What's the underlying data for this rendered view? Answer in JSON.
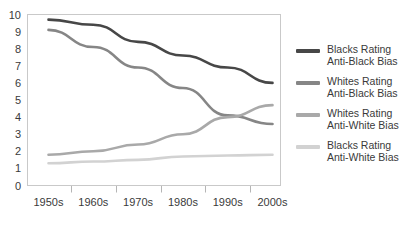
{
  "chart_data": {
    "type": "line",
    "title": "",
    "subtitle": "",
    "xlabel": "",
    "ylabel": "",
    "categories": [
      "1950s",
      "1960s",
      "1970s",
      "1980s",
      "1990s",
      "2000s"
    ],
    "x_tick_labels": [
      "1950s",
      "1960s",
      "1970s",
      "1980s",
      "1990s",
      "2000s"
    ],
    "y_tick_labels": [
      "0",
      "1",
      "2",
      "3",
      "4",
      "5",
      "6",
      "7",
      "8",
      "9",
      "10"
    ],
    "ylim": [
      0,
      10
    ],
    "y_tick_step": 1,
    "grid": false,
    "legend_position": "right",
    "series": [
      {
        "name": "Blacks Rating\nAnti-Black Bias",
        "color": "#474747",
        "values": [
          9.7,
          9.4,
          8.4,
          7.6,
          6.9,
          6.0
        ]
      },
      {
        "name": "Whites Rating\nAnti-Black Bias",
        "color": "#868686",
        "values": [
          9.1,
          8.1,
          6.9,
          5.7,
          4.1,
          3.6
        ]
      },
      {
        "name": "Whites Rating\nAnti-White Bias",
        "color": "#a9a9a9",
        "values": [
          1.8,
          2.0,
          2.4,
          3.0,
          4.0,
          4.7
        ]
      },
      {
        "name": "Blacks Rating\nAnti-White Bias",
        "color": "#d2d2d2",
        "values": [
          1.3,
          1.4,
          1.5,
          1.7,
          1.75,
          1.8
        ]
      }
    ]
  },
  "legend": {
    "entries": [
      {
        "label": "Blacks Rating\nAnti-Black Bias",
        "color": "#474747"
      },
      {
        "label": "Whites Rating\nAnti-Black Bias",
        "color": "#868686"
      },
      {
        "label": "Whites Rating\nAnti-White Bias",
        "color": "#a9a9a9"
      },
      {
        "label": "Blacks Rating\nAnti-White Bias",
        "color": "#d2d2d2"
      }
    ]
  },
  "axes": {
    "y_axis_name": "bias-rating-scale",
    "x_axis_name": "decade-axis"
  }
}
